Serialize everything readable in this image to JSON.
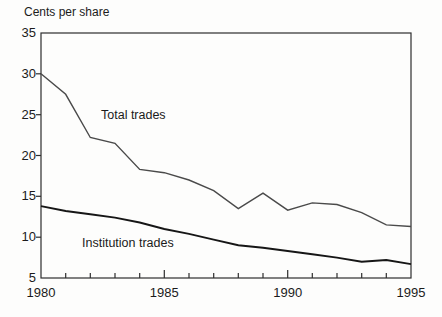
{
  "chart_data": {
    "type": "line",
    "title": "Cents per share",
    "x": [
      1980,
      1981,
      1982,
      1983,
      1984,
      1985,
      1986,
      1987,
      1988,
      1989,
      1990,
      1991,
      1992,
      1993,
      1994,
      1995
    ],
    "series": [
      {
        "name": "Total trades",
        "data_name": "total-trades",
        "values": [
          30.0,
          27.5,
          22.2,
          21.5,
          18.3,
          17.9,
          17.0,
          15.7,
          13.5,
          15.4,
          13.3,
          14.2,
          14.0,
          13.0,
          11.5,
          11.3
        ],
        "color": "#4a4a4a",
        "stroke_width": 1.4
      },
      {
        "name": "Institution trades",
        "data_name": "institution-trades",
        "values": [
          13.8,
          13.2,
          12.8,
          12.4,
          11.8,
          11.0,
          10.4,
          9.7,
          9.0,
          8.7,
          8.3,
          7.9,
          7.5,
          7.0,
          7.2,
          6.7
        ],
        "color": "#161616",
        "stroke_width": 1.9
      }
    ],
    "xlabel": "",
    "ylabel": "Cents per share",
    "xlim": [
      1980,
      1995
    ],
    "ylim": [
      5,
      35
    ],
    "y_ticks": [
      5,
      10,
      15,
      20,
      25,
      30,
      35
    ],
    "x_tick_labels": [
      1980,
      1985,
      1990,
      1995
    ],
    "grid": false,
    "legend_position": "inline-annotations",
    "axis_color": "#2e2e2e",
    "background": "#fdfdfc",
    "text_color": "#1b1b1b"
  }
}
